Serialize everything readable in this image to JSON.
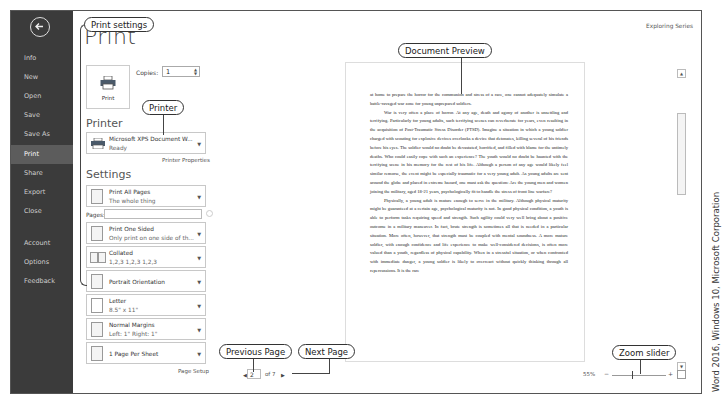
{
  "window": {
    "top_right_label": "Exploring Series"
  },
  "sidebar": {
    "back_icon": "back-arrow-icon",
    "items": [
      {
        "label": "Info",
        "active": false
      },
      {
        "label": "New",
        "active": false
      },
      {
        "label": "Open",
        "active": false
      },
      {
        "label": "Save",
        "active": false
      },
      {
        "label": "Save As",
        "active": false
      },
      {
        "label": "Print",
        "active": true
      },
      {
        "label": "Share",
        "active": false
      },
      {
        "label": "Export",
        "active": false
      },
      {
        "label": "Close",
        "active": false
      },
      {
        "label": "Account",
        "active": false
      },
      {
        "label": "Options",
        "active": false
      },
      {
        "label": "Feedback",
        "active": false
      }
    ]
  },
  "print_panel": {
    "title": "Print",
    "print_button_label": "Print",
    "copies_label": "Copies:",
    "copies_value": "1",
    "printer_section_title": "Printer",
    "printer": {
      "name": "Microsoft XPS Document W...",
      "status": "Ready"
    },
    "printer_properties_link": "Printer Properties",
    "settings_section_title": "Settings",
    "pages_label": "Pages:",
    "pages_value": "",
    "settings": [
      {
        "title": "Print All Pages",
        "subtitle": "The whole thing",
        "icon": "pages-icon"
      },
      {
        "title": "Print One Sided",
        "subtitle": "Only print on one side of th...",
        "icon": "one-sided-icon"
      },
      {
        "title": "Collated",
        "subtitle": "1,2,3   1,2,3   1,2,3",
        "icon": "collated-icon"
      },
      {
        "title": "Portrait Orientation",
        "subtitle": "",
        "icon": "portrait-icon"
      },
      {
        "title": "Letter",
        "subtitle": "8.5\" x 11\"",
        "icon": "paper-size-icon"
      },
      {
        "title": "Normal Margins",
        "subtitle": "Left:  1\"    Right:  1\"",
        "icon": "margins-icon"
      },
      {
        "title": "1 Page Per Sheet",
        "subtitle": "",
        "icon": "pages-per-sheet-icon"
      }
    ],
    "page_setup_link": "Page Setup"
  },
  "preview": {
    "paragraphs": [
      {
        "indent": false,
        "text": "at home to prepare the horror for the communion and stress of a race, one cannot adequately simulate a battle-ravaged war zone for young unprepared soldiers."
      },
      {
        "indent": true,
        "text": "War is very often a place of horror. At any age, death and agony of another is unsettling and terrifying. Particularly for young adults, such terrifying scenes can reverberate for years, even resulting in the acquisition of Post-Traumatic Stress Disorder (PTSD). Imagine a situation in which a young soldier charged with scouting for explosive devices overlooks a device that detonates, killing several of his friends before his eyes. The soldier would no doubt be devastated, horrified, and filled with blame for the untimely deaths. Who could easily cope with such an experience? The youth would no doubt be haunted with the terrifying scene in his memory for the rest of his life. Although a person of any age would likely feel similar remorse, the event might be especially traumatic for a very young adult. As young adults are sent around the globe and placed in extreme hazard, one must ask the question: Are the young men and women joining the military, aged 18-21 years, psychologically fit to handle the stress of front line warfare?"
      },
      {
        "indent": true,
        "text": "Physically, a young adult is mature enough to serve in the military. Although physical maturity might be guaranteed at a certain age, psychological maturity is not. In good physical condition, a youth is able to perform tasks requiring speed and strength. Such agility could very well bring about a positive outcome in a military maneuver. In fact, brute strength is sometimes all that is needed in a particular situation. More often, however, that strength must be coupled with mental soundness. A more mature soldier, with enough confidence and life experience to make well-considered decisions, is often more valued than a youth, regardless of physical capability. When in a stressful situation, or when confronted with immediate danger, a young soldier is likely to overreact without quickly thinking through all repercussions. It is the rare"
      }
    ]
  },
  "status_bar": {
    "current_page": "2",
    "of_pages": "of 7",
    "zoom_level": "55%",
    "zoom_minus": "−",
    "zoom_plus": "+"
  },
  "callouts": {
    "print_settings": "Print settings",
    "printer": "Printer",
    "document_preview": "Document Preview",
    "previous_page": "Previous Page",
    "next_page": "Next Page",
    "zoom_slider": "Zoom slider"
  },
  "credit": "Word 2016, Windows 10, Microsoft Corporation"
}
